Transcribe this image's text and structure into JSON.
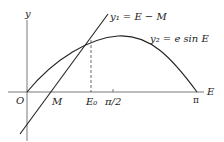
{
  "diagram": {
    "y_axis_label": "y",
    "x_axis_label": "E",
    "origin_label": "O",
    "line_label": "y₁ = E − M",
    "curve_label": "y₂ = e sin E",
    "ticks": {
      "M": "M",
      "E0": "E₀",
      "half_pi": "π/2",
      "pi": "π"
    },
    "colors": {
      "stroke": "#222222",
      "background": "#ffffff"
    }
  }
}
